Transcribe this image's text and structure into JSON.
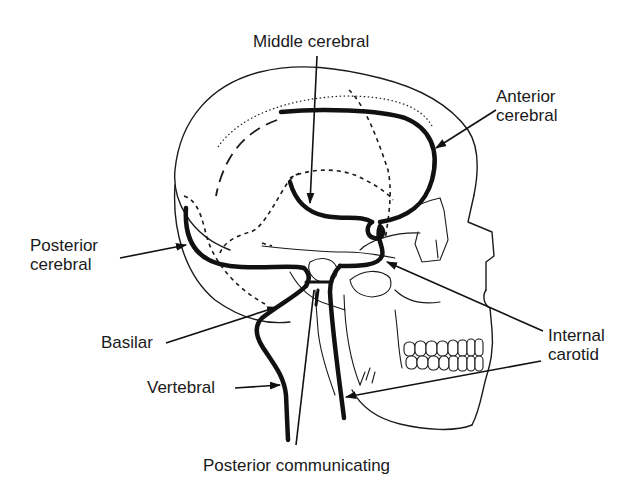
{
  "figure": {
    "ink_color": "#1a1a1a",
    "background_color": "#ffffff"
  },
  "labels": {
    "middle_cerebral": "Middle cerebral",
    "anterior_cerebral": [
      "Anterior",
      "cerebral"
    ],
    "posterior_cerebral": [
      "Posterior",
      "cerebral"
    ],
    "basilar": "Basilar",
    "vertebral": "Vertebral",
    "internal_carotid": [
      "Internal",
      "carotid"
    ],
    "posterior_communicating": "Posterior communicating"
  }
}
